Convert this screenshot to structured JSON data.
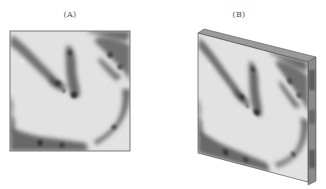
{
  "figure": {
    "panels": [
      {
        "id": "A",
        "label": "(A)",
        "description": "2D grayscale section image (flat square)"
      },
      {
        "id": "B",
        "label": "(B)",
        "description": "Same section rendered as a 3D slab with thickness"
      }
    ],
    "colors": {
      "background": "#ffffff",
      "tissue_light": "#e4e4e4",
      "tissue_dark": "#3a3a3a",
      "edge": "#666666"
    }
  }
}
